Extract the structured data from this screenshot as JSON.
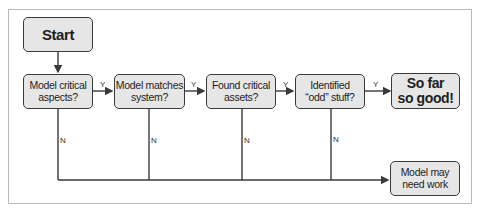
{
  "diagram": {
    "type": "flowchart",
    "nodes": {
      "start": "Start",
      "model_critical": "Model critical\naspects?",
      "model_matches": "Model matches\nsystem?",
      "found_assets": "Found critical\nassets?",
      "identified_odd": "Identified\n“odd” stuff?",
      "so_far_good": "So far\nso good!",
      "needs_work": "Model may\nneed work"
    },
    "edge_labels": {
      "yes": "Y",
      "no": "N"
    },
    "edges": [
      {
        "from": "start",
        "to": "model_critical",
        "label": ""
      },
      {
        "from": "model_critical",
        "to": "model_matches",
        "label": "Y"
      },
      {
        "from": "model_matches",
        "to": "found_assets",
        "label": "Y"
      },
      {
        "from": "found_assets",
        "to": "identified_odd",
        "label": "Y"
      },
      {
        "from": "identified_odd",
        "to": "so_far_good",
        "label": "Y"
      },
      {
        "from": "model_critical",
        "to": "needs_work",
        "label": "N"
      },
      {
        "from": "model_matches",
        "to": "needs_work",
        "label": "N"
      },
      {
        "from": "found_assets",
        "to": "needs_work",
        "label": "N"
      },
      {
        "from": "identified_odd",
        "to": "needs_work",
        "label": "N"
      }
    ],
    "colors": {
      "node_fill": "#e6e6e6",
      "node_border": "#3a3a3a",
      "line": "#3a3a3a",
      "frame": "#b9b9b9"
    }
  }
}
